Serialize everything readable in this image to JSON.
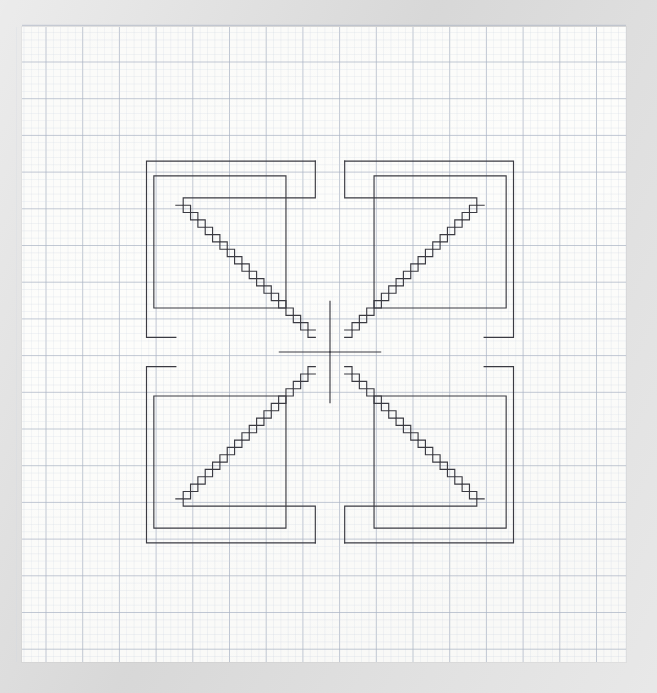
{
  "scene": {
    "width": 657,
    "height": 693,
    "background_color": "#dcdcdc",
    "title": "Hand-drawn symmetric staircase star on graph paper"
  },
  "paper": {
    "x": 22,
    "y": 27,
    "width": 604,
    "height": 635,
    "color": "#fdfdfb",
    "label": "graph-paper-sheet"
  },
  "grid": {
    "minor_cell_px": 7.34,
    "major_every": 5,
    "minor_color": "#cfd6e2",
    "major_color": "#aab3c4",
    "minor_opacity": 0.55,
    "major_opacity": 0.85,
    "origin_x": 46.0,
    "origin_y": 62.0,
    "cols": 80,
    "rows": 84
  },
  "drawing": {
    "ink_color": "#3a3a42",
    "stroke_width": 1.15,
    "center_x": 330,
    "center_y": 352,
    "cell": 7.34,
    "symmetry": "4-fold mirror (horizontal + vertical)",
    "outer_square": {
      "left": 46,
      "top": 62,
      "right": 614,
      "bottom": 642
    },
    "quadrant_inner_square_inset_cells": {
      "x_from_outer": 4,
      "y_from_outer": 4,
      "size_cells": 18
    },
    "staircase": {
      "steps": 18,
      "step_run_cells": 1,
      "step_rise_cells": 1,
      "note": "diagonal staircase from each quadrant corner box toward the common center"
    },
    "spokes": {
      "count": 8,
      "orthogonal": 4,
      "diagonal": 4
    }
  },
  "geometry": {
    "quadrant_outer_box_cells": {
      "w": 25,
      "h": 26
    },
    "arm_gap_cells": 2
  }
}
